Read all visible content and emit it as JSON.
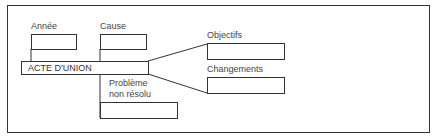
{
  "diagram": {
    "center": {
      "label": "ACTE D'UNION"
    },
    "fields": [
      {
        "id": "annee",
        "label": "Année",
        "value": ""
      },
      {
        "id": "cause",
        "label": "Cause",
        "value": ""
      },
      {
        "id": "probleme",
        "label": "Problème non résolu",
        "label_lines": [
          "Problème",
          "non résolu"
        ],
        "value": ""
      },
      {
        "id": "objectifs",
        "label": "Objectifs",
        "value": ""
      },
      {
        "id": "changements",
        "label": "Changements",
        "value": ""
      }
    ]
  }
}
